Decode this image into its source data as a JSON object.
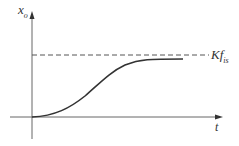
{
  "diagram": {
    "type": "step-response-plot",
    "y_axis": {
      "label_main": "x",
      "label_sub": "o"
    },
    "x_axis": {
      "label": "t"
    },
    "asymptote": {
      "label_main": "Kf",
      "label_sub": "is",
      "style": "dashed"
    },
    "curve": {
      "description": "S-shaped rise from origin approaching asymptote"
    },
    "colors": {
      "axis": "#555555",
      "curve": "#333333",
      "dash": "#555555",
      "text": "#333333"
    }
  }
}
